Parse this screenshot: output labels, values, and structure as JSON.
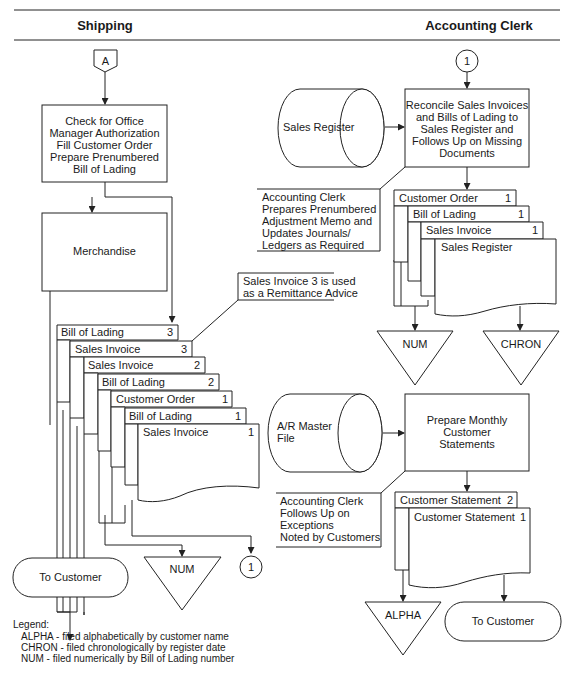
{
  "headers": {
    "left": "Shipping",
    "right": "Accounting Clerk"
  },
  "shipping": {
    "start_connector": "A",
    "process_box": [
      "Check for Office",
      "Manager Authorization",
      "Fill Customer Order",
      "Prepare Prenumbered",
      "Bill of Lading"
    ],
    "merchandise": "Merchandise",
    "annotation": [
      "Sales Invoice 3 is used",
      "as a Remittance Advice"
    ],
    "documents": [
      {
        "name": "Bill of Lading",
        "copy": "3"
      },
      {
        "name": "Sales Invoice",
        "copy": "3"
      },
      {
        "name": "Sales Invoice",
        "copy": "2"
      },
      {
        "name": "Bill of Lading",
        "copy": "2"
      },
      {
        "name": "Customer Order",
        "copy": "1"
      },
      {
        "name": "Bill of Lading",
        "copy": "1"
      },
      {
        "name": "Sales Invoice",
        "copy": "1"
      }
    ],
    "terminal": "To Customer",
    "file": "NUM",
    "off_connector": "1"
  },
  "accounting": {
    "in_connector": "1",
    "sales_register_store": "Sales Register",
    "reconcile_box": [
      "Reconcile Sales Invoices",
      "and Bills of Lading to",
      "Sales Register and",
      "Follows Up on Missing",
      "Documents"
    ],
    "annotation1": [
      "Accounting Clerk",
      "Prepares Prenumbered",
      "Adjustment Memo and",
      "Updates Journals/",
      "Ledgers as Required"
    ],
    "documents": [
      {
        "name": "Customer Order",
        "copy": "1"
      },
      {
        "name": "Bill of Lading",
        "copy": "1"
      },
      {
        "name": "Sales Invoice",
        "copy": "1"
      },
      {
        "name": "Sales Register",
        "copy": ""
      }
    ],
    "file_num": "NUM",
    "file_chron": "CHRON",
    "ar_store": [
      "A/R Master",
      "File"
    ],
    "statements_box": [
      "Prepare Monthly",
      "Customer",
      "Statements"
    ],
    "annotation2": [
      "Accounting Clerk",
      "Follows Up on",
      "Exceptions",
      "Noted by Customers"
    ],
    "statements": [
      {
        "name": "Customer Statement",
        "copy": "2"
      },
      {
        "name": "Customer Statement",
        "copy": "1"
      }
    ],
    "file_alpha": "ALPHA",
    "terminal": "To Customer"
  },
  "legend": {
    "title": "Legend:",
    "items": [
      "ALPHA - filed alphabetically by customer name",
      "CHRON - filed chronologically by register date",
      "NUM - filed numerically by Bill of Lading number"
    ]
  }
}
